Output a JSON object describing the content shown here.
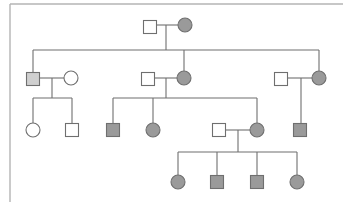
{
  "diagram": {
    "type": "pedigree-chart",
    "legend_colors": {
      "affected": "#9a9a9a",
      "carrier_light": "#cfcfcf",
      "unaffected": "#ffffff",
      "line": "#6f6f6f",
      "frame": "#b4b4b4"
    },
    "generations": [
      {
        "label": "I",
        "individuals": [
          {
            "id": "I-1",
            "sex": "male",
            "status": "unaffected",
            "x": 150,
            "y": 27
          },
          {
            "id": "I-2",
            "sex": "female",
            "status": "affected",
            "x": 185,
            "y": 25
          }
        ]
      },
      {
        "label": "II",
        "individuals": [
          {
            "id": "II-1",
            "sex": "male",
            "status": "carrier_light",
            "x": 33,
            "y": 79
          },
          {
            "id": "II-2",
            "sex": "female",
            "status": "unaffected",
            "x": 71,
            "y": 78
          },
          {
            "id": "II-3",
            "sex": "male",
            "status": "unaffected",
            "x": 148,
            "y": 79
          },
          {
            "id": "II-4",
            "sex": "female",
            "status": "affected",
            "x": 184,
            "y": 78
          },
          {
            "id": "II-5",
            "sex": "male",
            "status": "unaffected",
            "x": 281,
            "y": 79
          },
          {
            "id": "II-6",
            "sex": "female",
            "status": "affected",
            "x": 319,
            "y": 78
          }
        ]
      },
      {
        "label": "III",
        "individuals": [
          {
            "id": "III-1",
            "sex": "female",
            "status": "unaffected",
            "x": 33,
            "y": 130
          },
          {
            "id": "III-2",
            "sex": "male",
            "status": "unaffected",
            "x": 72,
            "y": 130
          },
          {
            "id": "III-3",
            "sex": "male",
            "status": "affected",
            "x": 113,
            "y": 130
          },
          {
            "id": "III-4",
            "sex": "female",
            "status": "affected",
            "x": 153,
            "y": 130
          },
          {
            "id": "III-5",
            "sex": "male",
            "status": "unaffected",
            "x": 219,
            "y": 130
          },
          {
            "id": "III-6",
            "sex": "female",
            "status": "affected",
            "x": 257,
            "y": 130
          },
          {
            "id": "III-7",
            "sex": "male",
            "status": "affected",
            "x": 300,
            "y": 130
          }
        ]
      },
      {
        "label": "IV",
        "individuals": [
          {
            "id": "IV-1",
            "sex": "female",
            "status": "affected",
            "x": 178,
            "y": 182
          },
          {
            "id": "IV-2",
            "sex": "male",
            "status": "affected",
            "x": 217,
            "y": 182
          },
          {
            "id": "IV-3",
            "sex": "male",
            "status": "affected",
            "x": 257,
            "y": 182
          },
          {
            "id": "IV-4",
            "sex": "female",
            "status": "affected",
            "x": 297,
            "y": 182
          }
        ]
      }
    ],
    "matings": [
      {
        "partners": [
          "I-1",
          "I-2"
        ],
        "children": [
          "II-1",
          "II-4",
          "II-6"
        ]
      },
      {
        "partners": [
          "II-1",
          "II-2"
        ],
        "children": [
          "III-1",
          "III-2"
        ]
      },
      {
        "partners": [
          "II-3",
          "II-4"
        ],
        "children": [
          "III-3",
          "III-4",
          "III-6"
        ]
      },
      {
        "partners": [
          "II-5",
          "II-6"
        ],
        "children": [
          "III-7"
        ]
      },
      {
        "partners": [
          "III-5",
          "III-6"
        ],
        "children": [
          "IV-1",
          "IV-2",
          "IV-3",
          "IV-4"
        ]
      }
    ]
  }
}
